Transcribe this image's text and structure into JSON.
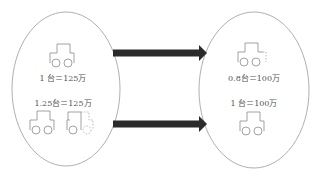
{
  "diagram": {
    "type": "flow",
    "colors": {
      "outline": "#9a9a9a",
      "icon_stroke": "#8a8a8a",
      "arrow": "#2b2b2b",
      "text": "#555555"
    },
    "left_group": {
      "items": [
        {
          "icon": "car-icon",
          "count": 1,
          "label": "1 台＝125万"
        },
        {
          "icon": "car-icon-plus-quarter",
          "count": 1.25,
          "label": "1.25台＝125万"
        }
      ]
    },
    "right_group": {
      "items": [
        {
          "icon": "car-icon-partial-0.8",
          "count": 0.8,
          "label": "0.8台＝100万"
        },
        {
          "icon": "car-icon",
          "count": 1,
          "label": "1 台＝100万"
        }
      ]
    },
    "arrows": [
      {
        "from": "left_group.items.0",
        "to": "right_group.items.0"
      },
      {
        "from": "left_group.items.1",
        "to": "right_group.items.1"
      }
    ]
  }
}
